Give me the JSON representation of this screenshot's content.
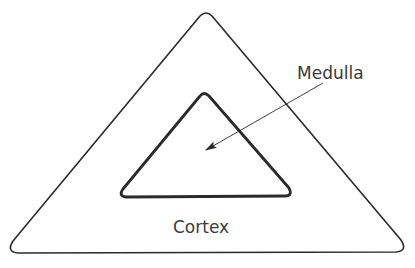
{
  "diagram": {
    "labels": {
      "inner": "Medulla",
      "outer": "Cortex"
    },
    "colors": {
      "stroke": "#2a2a2a",
      "text": "#3a3a3a",
      "background": "#ffffff"
    }
  }
}
